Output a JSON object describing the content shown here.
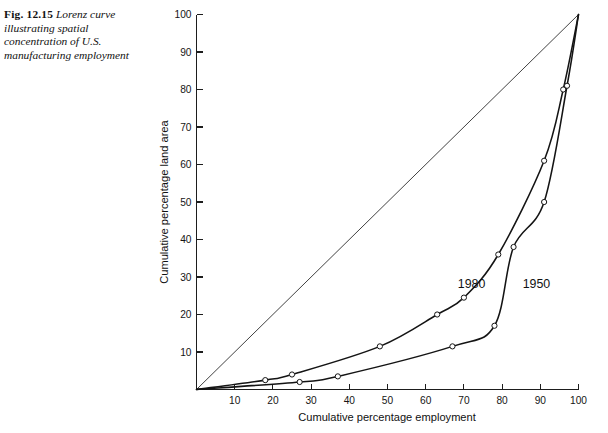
{
  "caption": {
    "figure_number": "Fig. 12.15",
    "text": "Lorenz curve illustrating spatial concentration of U.S. manufacturing employment"
  },
  "chart_data": {
    "type": "line",
    "title": "",
    "xlabel": "Cumulative percentage employment",
    "ylabel": "Cumulative percentage land area",
    "xlim": [
      0,
      100
    ],
    "ylim": [
      0,
      100
    ],
    "xticks": [
      10,
      20,
      30,
      40,
      50,
      60,
      70,
      80,
      90,
      100
    ],
    "yticks": [
      10,
      20,
      30,
      40,
      50,
      60,
      70,
      80,
      90,
      100
    ],
    "grid": false,
    "legend": "inline-annotations",
    "reference_line": {
      "name": "line of equality",
      "x": [
        0,
        100
      ],
      "y": [
        0,
        100
      ]
    },
    "series": [
      {
        "name": "1980",
        "label": "1980",
        "label_x": 72,
        "label_y": 27,
        "x": [
          0,
          18,
          25,
          48,
          63,
          70,
          79,
          91,
          96,
          100
        ],
        "y": [
          0,
          2.5,
          4,
          11.5,
          20,
          24.5,
          36,
          61,
          80,
          100
        ]
      },
      {
        "name": "1950",
        "label": "1950",
        "label_x": 89,
        "label_y": 27,
        "x": [
          0,
          27,
          37,
          67,
          78,
          83,
          91,
          97,
          100
        ],
        "y": [
          0,
          2,
          3.5,
          11.5,
          17,
          38,
          50,
          81,
          100
        ]
      }
    ]
  }
}
